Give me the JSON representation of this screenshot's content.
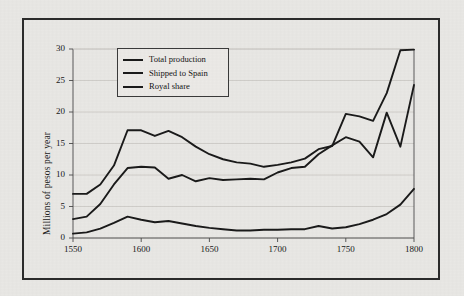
{
  "figure": {
    "background_color": "#e9e8e5",
    "frame_color": "#2b2b2b",
    "line_color": "#1a1a1a",
    "grid_color": "#c9c7c3"
  },
  "chart_data": {
    "type": "line",
    "title": "",
    "xlabel": "",
    "ylabel": "Millions of pesos per year",
    "xlim": [
      1550,
      1800
    ],
    "ylim": [
      0,
      30
    ],
    "xticks": [
      1550,
      1600,
      1650,
      1700,
      1750,
      1800
    ],
    "yticks": [
      0,
      5,
      10,
      15,
      20,
      25,
      30
    ],
    "grid": true,
    "grid_axis": "y",
    "legend_position": "upper left",
    "x": [
      1550,
      1560,
      1570,
      1580,
      1590,
      1600,
      1610,
      1620,
      1630,
      1640,
      1650,
      1660,
      1670,
      1680,
      1690,
      1700,
      1710,
      1720,
      1730,
      1740,
      1750,
      1760,
      1770,
      1780,
      1790,
      1800
    ],
    "series": [
      {
        "name": "Total production",
        "values": [
          7.0,
          7.0,
          8.5,
          11.5,
          17.1,
          17.1,
          16.2,
          17.0,
          16.0,
          14.5,
          13.3,
          12.5,
          12.0,
          11.8,
          11.3,
          11.6,
          12.0,
          12.6,
          14.1,
          14.6,
          19.7,
          19.3,
          18.6,
          23.0,
          29.8,
          29.9
        ]
      },
      {
        "name": "Shipped to Spain",
        "values": [
          3.0,
          3.4,
          5.4,
          8.5,
          11.1,
          11.3,
          11.2,
          9.4,
          10.0,
          9.0,
          9.5,
          9.2,
          9.3,
          9.4,
          9.3,
          10.4,
          11.1,
          11.3,
          13.3,
          14.7,
          16.0,
          15.3,
          12.8,
          19.9,
          14.5,
          24.3
        ]
      },
      {
        "name": "Royal share",
        "values": [
          0.7,
          0.9,
          1.5,
          2.4,
          3.4,
          2.9,
          2.5,
          2.7,
          2.3,
          1.9,
          1.6,
          1.4,
          1.2,
          1.2,
          1.3,
          1.3,
          1.4,
          1.4,
          1.9,
          1.5,
          1.7,
          2.2,
          2.9,
          3.8,
          5.3,
          7.8
        ]
      }
    ]
  },
  "legend": {
    "items": [
      {
        "label": "Total production"
      },
      {
        "label": "Shipped to Spain"
      },
      {
        "label": "Royal share"
      }
    ]
  }
}
